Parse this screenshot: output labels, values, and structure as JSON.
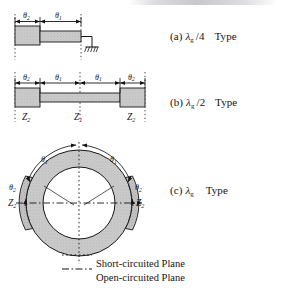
{
  "figure": {
    "type": "technical-line-drawing",
    "background": "#ffffff",
    "ink": "#141414",
    "fill_metal": "#c9c9c9",
    "fill_metal_dark": "#bdbdbd"
  },
  "panels": [
    {
      "id": "a",
      "caption_index": "(a)",
      "lambda": "λ",
      "lambda_sub": "g",
      "fraction": "/4",
      "type_word": "Type",
      "dimensions": [
        "θ₂",
        "θ₁"
      ],
      "termination": "ground-symbol",
      "planes": [
        "short-circuited-right",
        "open-circuited-left"
      ]
    },
    {
      "id": "b",
      "caption_index": "(b)",
      "lambda": "λ",
      "lambda_sub": "g",
      "fraction": "/2",
      "type_word": "Type",
      "dimensions": [
        "θ₂",
        "θ₁",
        "θ₁",
        "θ₂"
      ],
      "impedances": [
        "Z₂",
        "Z₁",
        "Z₂"
      ],
      "planes": [
        "short-circuited-center",
        "open-circuited-ends"
      ]
    },
    {
      "id": "c",
      "caption_index": "(c)",
      "lambda": "λ",
      "lambda_sub": "g",
      "fraction": "",
      "type_word": "Type",
      "dimensions_outer": [
        "θ₁",
        "θ₁"
      ],
      "dimensions_side": [
        "θ₂",
        "θ₂"
      ],
      "impedances": [
        "Z₂",
        "Z₂"
      ],
      "shape": "ring-resonator"
    }
  ],
  "legend": {
    "short": {
      "label": "Short-circuited Plane",
      "style": "dotted"
    },
    "open": {
      "label": "Open-circuited Plane",
      "style": "dash-dot"
    }
  }
}
